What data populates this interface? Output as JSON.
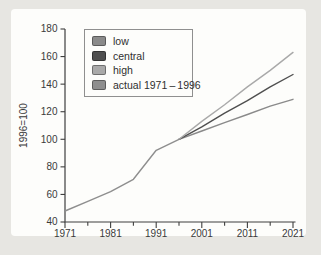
{
  "figure": {
    "outer_background": "#e7e6e2",
    "card_background": "#fdfdfb",
    "axis_color": "#3f3f3f",
    "text_color": "#3a3a3a"
  },
  "chart_data": {
    "type": "line",
    "title": "",
    "xlabel": "",
    "ylabel": "1996=100",
    "xlim": [
      1971,
      2021
    ],
    "ylim": [
      40,
      180
    ],
    "y_ticks": [
      40,
      60,
      80,
      100,
      120,
      140,
      160,
      180
    ],
    "x_ticks": [
      1971,
      1981,
      1991,
      2001,
      2011,
      2021
    ],
    "x_minor_tick_interval": 5,
    "grid": "off",
    "legend_position": "top-left-inside",
    "series": [
      {
        "name": "low",
        "color": "#8a8a8a",
        "points": [
          [
            1996,
            100
          ],
          [
            2001,
            106
          ],
          [
            2006,
            112
          ],
          [
            2011,
            118
          ],
          [
            2016,
            124
          ],
          [
            2021,
            129
          ]
        ]
      },
      {
        "name": "central",
        "color": "#4f4f4f",
        "points": [
          [
            1996,
            100
          ],
          [
            2001,
            109
          ],
          [
            2006,
            119
          ],
          [
            2011,
            128
          ],
          [
            2016,
            138
          ],
          [
            2021,
            147
          ]
        ]
      },
      {
        "name": "high",
        "color": "#a9a9a9",
        "points": [
          [
            1996,
            100
          ],
          [
            2001,
            113
          ],
          [
            2006,
            125
          ],
          [
            2011,
            138
          ],
          [
            2016,
            150
          ],
          [
            2021,
            163
          ]
        ]
      },
      {
        "name": "actual 1971 – 1996",
        "color": "#8e8e8e",
        "points": [
          [
            1971,
            48
          ],
          [
            1976,
            55
          ],
          [
            1981,
            62
          ],
          [
            1986,
            71
          ],
          [
            1991,
            92
          ],
          [
            1996,
            100
          ]
        ]
      }
    ]
  }
}
